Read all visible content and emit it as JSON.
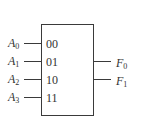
{
  "diagram": {
    "type": "block",
    "block": {
      "name": "mux-block"
    },
    "inputs": [
      {
        "base": "A",
        "sub": "0",
        "code": "00"
      },
      {
        "base": "A",
        "sub": "1",
        "code": "01"
      },
      {
        "base": "A",
        "sub": "2",
        "code": "10"
      },
      {
        "base": "A",
        "sub": "3",
        "code": "11"
      }
    ],
    "outputs": [
      {
        "base": "F",
        "sub": "0"
      },
      {
        "base": "F",
        "sub": "1"
      }
    ],
    "colors": {
      "stroke": "#3a3a3a",
      "text": "#333333",
      "background": "#ffffff"
    }
  }
}
